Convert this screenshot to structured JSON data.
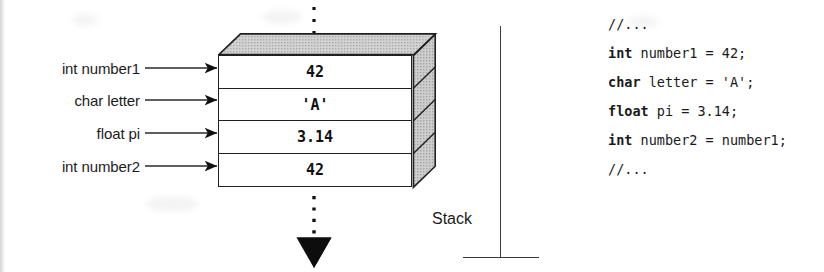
{
  "figure": {
    "stack_caption": "Stack"
  },
  "labels": [
    {
      "name": "label-int-number1",
      "text": "int number1"
    },
    {
      "name": "label-char-letter",
      "text": "char letter"
    },
    {
      "name": "label-float-pi",
      "text": "float pi"
    },
    {
      "name": "label-int-number2",
      "text": "int number2"
    }
  ],
  "stack_cells": [
    {
      "name": "stack-cell-number1",
      "value": "42"
    },
    {
      "name": "stack-cell-letter",
      "value": "'A'"
    },
    {
      "name": "stack-cell-pi",
      "value": "3.14"
    },
    {
      "name": "stack-cell-number2",
      "value": "42"
    }
  ],
  "code": {
    "lines": [
      {
        "keyword": "",
        "rest": "//..."
      },
      {
        "keyword": "int",
        "rest": " number1 = 42;"
      },
      {
        "keyword": "char",
        "rest": " letter = 'A';"
      },
      {
        "keyword": "float",
        "rest": " pi = 3.14;"
      },
      {
        "keyword": "int",
        "rest": " number2 = number1;"
      },
      {
        "keyword": "",
        "rest": "//..."
      }
    ]
  },
  "colors": {
    "ink": "#1a1a1a",
    "rule": "#202020",
    "box_top_face": "#c9c9c9",
    "box_side_face": "#c4c4c4",
    "paper": "#ffffff"
  },
  "annotations": {
    "growth_arrow_direction": "down",
    "top_continuation": "dotted",
    "bottom_continuation": "dotted-with-arrowhead"
  }
}
